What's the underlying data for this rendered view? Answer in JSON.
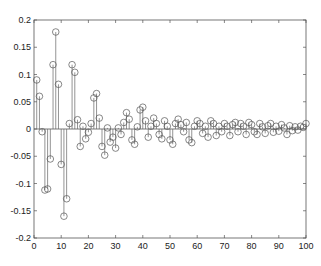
{
  "chart_data": {
    "type": "stem",
    "title": "",
    "xlabel": "",
    "ylabel": "",
    "xlim": [
      0,
      100
    ],
    "ylim": [
      -0.2,
      0.2
    ],
    "grid": false,
    "x_ticks": [
      0,
      10,
      20,
      30,
      40,
      50,
      60,
      70,
      80,
      90,
      100
    ],
    "y_ticks": [
      -0.2,
      -0.15,
      -0.1,
      -0.05,
      0,
      0.05,
      0.1,
      0.15,
      0.2
    ],
    "y_tick_labels": [
      "-0.2",
      "-0.15",
      "-0.1",
      "-0.05",
      "0",
      "0.05",
      "0.1",
      "0.15",
      "0.2"
    ],
    "x": [
      1,
      2,
      3,
      4,
      5,
      6,
      7,
      8,
      9,
      10,
      11,
      12,
      13,
      14,
      15,
      16,
      17,
      18,
      19,
      20,
      21,
      22,
      23,
      24,
      25,
      26,
      27,
      28,
      29,
      30,
      31,
      32,
      33,
      34,
      35,
      36,
      37,
      38,
      39,
      40,
      41,
      42,
      43,
      44,
      45,
      46,
      47,
      48,
      49,
      50,
      51,
      52,
      53,
      54,
      55,
      56,
      57,
      58,
      59,
      60,
      61,
      62,
      63,
      64,
      65,
      66,
      67,
      68,
      69,
      70,
      71,
      72,
      73,
      74,
      75,
      76,
      77,
      78,
      79,
      80,
      81,
      82,
      83,
      84,
      85,
      86,
      87,
      88,
      89,
      90,
      91,
      92,
      93,
      94,
      95,
      96,
      97,
      98,
      99,
      100
    ],
    "values": [
      0.09,
      0.06,
      -0.005,
      -0.112,
      -0.11,
      -0.055,
      0.118,
      0.178,
      0.082,
      -0.065,
      -0.16,
      -0.128,
      0.01,
      0.118,
      0.104,
      0.017,
      -0.032,
      0.005,
      -0.018,
      -0.006,
      0.01,
      0.057,
      0.065,
      0.02,
      -0.032,
      -0.048,
      0.002,
      -0.024,
      -0.015,
      -0.035,
      0.002,
      -0.01,
      0.012,
      0.03,
      0.018,
      -0.02,
      -0.028,
      0.004,
      0.035,
      0.04,
      0.015,
      -0.015,
      0.005,
      0.02,
      0.01,
      -0.01,
      -0.018,
      0.015,
      0.005,
      -0.02,
      -0.028,
      0.01,
      0.018,
      0.008,
      -0.005,
      0.012,
      -0.02,
      -0.025,
      0.005,
      0.015,
      0.01,
      -0.008,
      0.005,
      -0.015,
      0.015,
      0.01,
      -0.012,
      0.005,
      -0.005,
      0.01,
      0.005,
      -0.012,
      0.008,
      0.012,
      -0.005,
      0.01,
      0.005,
      -0.01,
      0.012,
      0.008,
      -0.005,
      -0.01,
      0.01,
      0.004,
      -0.008,
      0.006,
      0.01,
      -0.006,
      0.005,
      -0.004,
      0.008,
      0.002,
      -0.01,
      0.006,
      -0.003,
      0.004,
      -0.002,
      0.005,
      0.003,
      0.01
    ]
  }
}
